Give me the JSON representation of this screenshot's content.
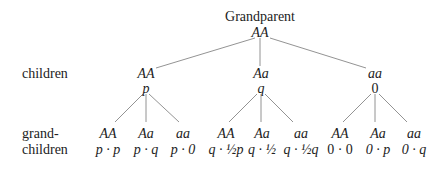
{
  "root": {
    "title": "Grandparent",
    "genotype": "AA"
  },
  "row_labels": {
    "children": "children",
    "grandchildren_line1": "grand-",
    "grandchildren_line2": "children"
  },
  "children": [
    {
      "genotype": "AA",
      "prob": "p",
      "grandchildren": [
        {
          "genotype": "AA",
          "prob": "p · p"
        },
        {
          "genotype": "Aa",
          "prob": "p · q"
        },
        {
          "genotype": "aa",
          "prob": "p · 0"
        }
      ]
    },
    {
      "genotype": "Aa",
      "prob": "q",
      "grandchildren": [
        {
          "genotype": "AA",
          "prob": "q · ½p"
        },
        {
          "genotype": "Aa",
          "prob": "q · ½"
        },
        {
          "genotype": "aa",
          "prob": "q · ½q"
        }
      ]
    },
    {
      "genotype": "aa",
      "prob": "0",
      "grandchildren": [
        {
          "genotype": "AA",
          "prob": "0 · 0"
        },
        {
          "genotype": "Aa",
          "prob": "0 · p"
        },
        {
          "genotype": "aa",
          "prob": "0 · q"
        }
      ]
    }
  ]
}
